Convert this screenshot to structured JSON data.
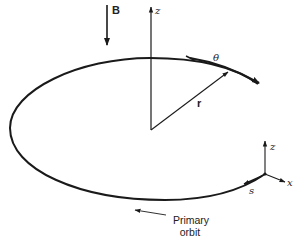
{
  "diagram": {
    "labels": {
      "magnetic_field": "B",
      "z_axis_main": "z",
      "radius_vector": "r",
      "theta_direction": "θ",
      "local_z": "z",
      "local_x": "x",
      "local_s": "s",
      "orbit_label_line1": "Primary",
      "orbit_label_line2": "orbit"
    },
    "colors": {
      "stroke": "#1a1a1a",
      "text": "#222222",
      "background": "#ffffff"
    }
  }
}
